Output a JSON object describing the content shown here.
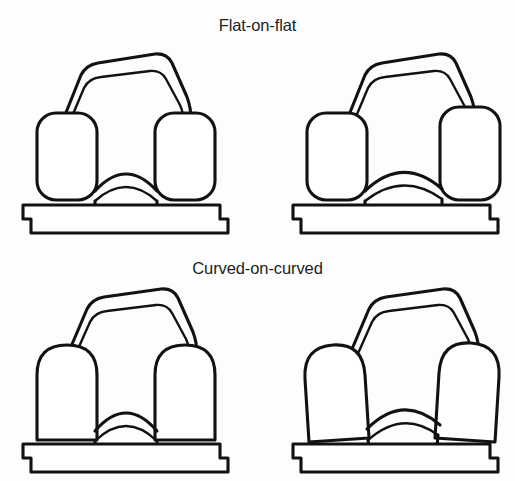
{
  "figure": {
    "background_color": "#fdfdfd",
    "line_color": "#131211",
    "fill_color": "#ffffff",
    "label_color": "#211f1e",
    "layout": "2-rows-x-2-columns"
  },
  "sections": [
    {
      "id": "flat-on-flat",
      "label": "Flat-on-flat",
      "panels": [
        {
          "id": "flat-aligned",
          "position": "top-left",
          "condyle_shape": "rounded-rectangle",
          "femoral_state": "centered",
          "parts": [
            "femoral-component",
            "medial-condyle",
            "lateral-condyle",
            "intercondylar-eminence",
            "tibial-tray"
          ]
        },
        {
          "id": "flat-displaced",
          "position": "top-right",
          "condyle_shape": "rounded-rectangle",
          "femoral_state": "shifted-right",
          "parts": [
            "femoral-component",
            "medial-condyle",
            "lateral-condyle",
            "intercondylar-eminence",
            "tibial-tray"
          ]
        }
      ]
    },
    {
      "id": "curved-on-curved",
      "label": "Curved-on-curved",
      "panels": [
        {
          "id": "curved-aligned",
          "position": "bottom-left",
          "condyle_shape": "dome",
          "femoral_state": "centered",
          "parts": [
            "femoral-component",
            "medial-condyle",
            "lateral-condyle",
            "intercondylar-eminence",
            "tibial-tray"
          ]
        },
        {
          "id": "curved-displaced",
          "position": "bottom-right",
          "condyle_shape": "dome",
          "femoral_state": "shifted-right",
          "parts": [
            "femoral-component",
            "medial-condyle",
            "lateral-condyle",
            "intercondylar-eminence",
            "tibial-tray"
          ]
        }
      ]
    }
  ]
}
